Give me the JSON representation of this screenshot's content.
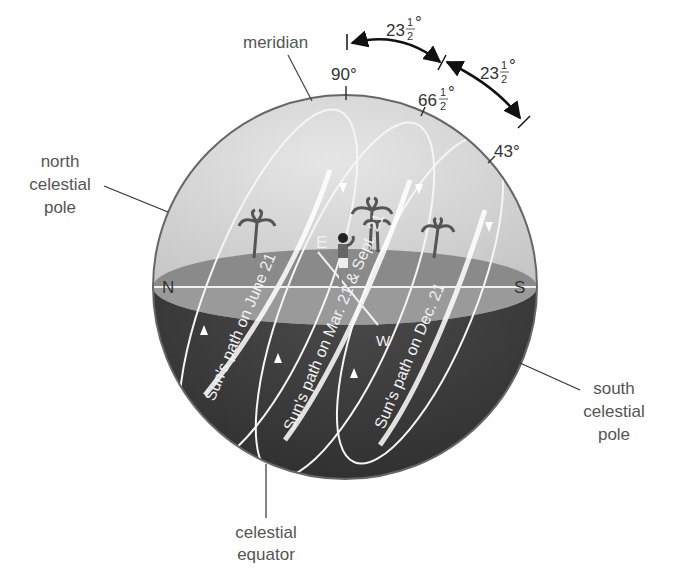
{
  "labels": {
    "meridian": "meridian",
    "north_pole": [
      "north",
      "celestial",
      "pole"
    ],
    "south_pole": [
      "south",
      "celestial",
      "pole"
    ],
    "celestial_equator": [
      "celestial",
      "equator"
    ]
  },
  "directions": {
    "north": "N",
    "south": "S",
    "east": "E",
    "west": "W"
  },
  "altitudes": {
    "zenith": "90°",
    "equinox_whole": "66",
    "dec_solstice": "43°"
  },
  "fraction": {
    "num": "1",
    "den": "2",
    "deg": "°"
  },
  "tilt_arcs": [
    {
      "whole": "23"
    },
    {
      "whole": "23"
    }
  ],
  "sun_paths": [
    {
      "label": "Sun's path on June 21"
    },
    {
      "label": "Sun's path on Mar. 21 & Sept. 21"
    },
    {
      "label": "Sun's path on Dec. 21"
    }
  ],
  "colors": {
    "sky_dome": "#d4d4d4",
    "ground": "#8e8e8e",
    "lower_sphere": "#3a3a3a",
    "path_stroke": "#f5f5f5",
    "label_gray": "#555555"
  }
}
